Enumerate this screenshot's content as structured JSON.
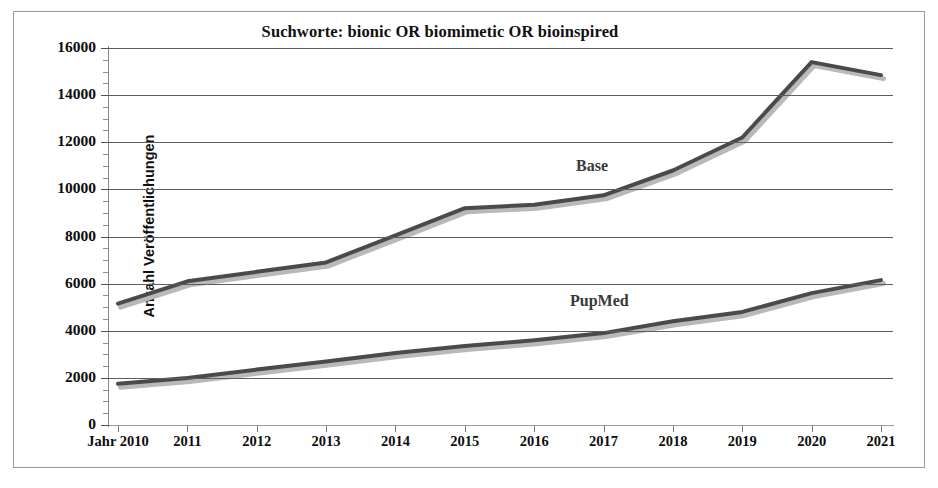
{
  "figure": {
    "title": "Suchworte: bionic OR biomimetic OR bioinspired"
  },
  "axes": {
    "y_title": "Anzahl Veröffentlichungen",
    "y_ticks": [
      "0",
      "2000",
      "4000",
      "6000",
      "8000",
      "10000",
      "12000",
      "14000",
      "16000"
    ],
    "x_ticks": [
      "Jahr 2010",
      "2011",
      "2012",
      "2013",
      "2014",
      "2015",
      "2016",
      "2017",
      "2018",
      "2019",
      "2020",
      "2021"
    ]
  },
  "series_labels": {
    "base": "Base",
    "pupmed": "PupMed"
  },
  "colors": {
    "line": "#4a4a4a",
    "shadow": "#b9b9b9",
    "gridline": "#5d5d5d",
    "text": "#0d0d0d",
    "frame": "#9a9a9a",
    "background": "#ffffff"
  },
  "chart_data": {
    "type": "line",
    "title": "Suchworte: bionic OR biomimetic OR bioinspired",
    "xlabel": "Jahr",
    "ylabel": "Anzahl Veröffentlichungen",
    "x": [
      2010,
      2011,
      2012,
      2013,
      2014,
      2015,
      2016,
      2017,
      2018,
      2019,
      2020,
      2021
    ],
    "categories": [
      "Jahr 2010",
      "2011",
      "2012",
      "2013",
      "2014",
      "2015",
      "2016",
      "2017",
      "2018",
      "2019",
      "2020",
      "2021"
    ],
    "ylim": [
      0,
      16000
    ],
    "ytick_step": 2000,
    "yminor_step": 500,
    "grid": true,
    "legend": "inline-labels",
    "series": [
      {
        "name": "Base",
        "values": [
          5150,
          6100,
          6500,
          6900,
          8050,
          9200,
          9350,
          9750,
          10800,
          12200,
          15400,
          14850
        ]
      },
      {
        "name": "PupMed",
        "values": [
          1750,
          2000,
          2350,
          2700,
          3050,
          3350,
          3600,
          3900,
          4400,
          4800,
          5600,
          6150
        ]
      }
    ]
  }
}
